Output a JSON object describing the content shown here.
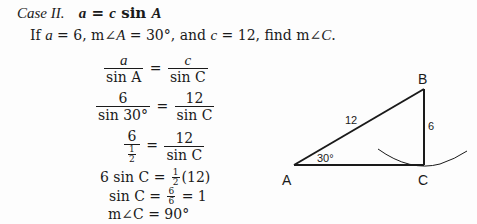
{
  "heading": {
    "case": "Case II.",
    "formula_a": "a",
    "formula_eq": " = ",
    "formula_c": "c",
    "formula_sin": " sin ",
    "formula_A": "A"
  },
  "problem": {
    "text_1": "If ",
    "a": "a",
    "t2": " = 6, m∠",
    "A": "A",
    "t3": " = 30°, and ",
    "c": "c",
    "t4": " = 12, find m∠",
    "C": "C",
    "t5": "."
  },
  "steps": {
    "s1": {
      "ln": "a",
      "ld": "sin A",
      "rn": "c",
      "rd": "sin C"
    },
    "s2": {
      "ln": "6",
      "ld": "sin 30°",
      "rn": "12",
      "rd": "sin C"
    },
    "s3": {
      "ln": "6",
      "ldn": "1",
      "ldd": "2",
      "rn": "12",
      "rd": "sin C"
    },
    "s4": {
      "left": "6 sin C",
      "eq": " = ",
      "fn": "1",
      "fd": "2",
      "right": "(12)"
    },
    "s5": {
      "left": "sin C",
      "eq": " = ",
      "fn": "6",
      "fd": "6",
      "right": " = 1"
    },
    "s6": {
      "text": "m∠C = 90°"
    }
  },
  "diagram": {
    "vertices": {
      "A": "A",
      "B": "B",
      "C": "C"
    },
    "side_AB": "12",
    "side_BC": "6",
    "angle_A": "30°"
  }
}
